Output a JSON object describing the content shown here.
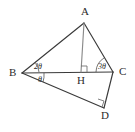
{
  "figure": {
    "type": "geometry-diagram",
    "background_color": "#ffffff",
    "stroke_color": "#3a3a3a",
    "altitude_color": "#8a8a8a",
    "vertices": [
      {
        "id": "A",
        "label": "A",
        "x": 84,
        "y": 23,
        "label_x": 81,
        "label_y": 6
      },
      {
        "id": "B",
        "label": "B",
        "x": 22,
        "y": 73,
        "label_x": 9,
        "label_y": 67
      },
      {
        "id": "C",
        "label": "C",
        "x": 113,
        "y": 72,
        "label_x": 119,
        "label_y": 66
      },
      {
        "id": "H",
        "label": "H",
        "x": 81,
        "y": 72,
        "label_x": 77,
        "label_y": 75
      },
      {
        "id": "D",
        "label": "D",
        "x": 104,
        "y": 108,
        "label_x": 101,
        "label_y": 110
      }
    ],
    "segments": [
      {
        "id": "BA",
        "from": "B",
        "to": "A",
        "style": "solid"
      },
      {
        "id": "AC",
        "from": "A",
        "to": "C",
        "style": "solid"
      },
      {
        "id": "BC",
        "from": "B",
        "to": "C",
        "style": "solid"
      },
      {
        "id": "AH",
        "from": "A",
        "to": "H",
        "style": "altitude"
      },
      {
        "id": "BD",
        "from": "B",
        "to": "D",
        "style": "solid"
      },
      {
        "id": "DC",
        "from": "D",
        "to": "C",
        "style": "solid"
      }
    ],
    "angle_labels": [
      {
        "id": "angle-ABC",
        "text": "2θ",
        "at_vertex": "B",
        "x": 34,
        "y": 63
      },
      {
        "id": "angle-DBC",
        "text": "θ",
        "at_vertex": "B",
        "x": 38,
        "y": 76
      },
      {
        "id": "angle-ACB",
        "text": "3θ",
        "at_vertex": "C",
        "x": 98,
        "y": 63
      }
    ],
    "right_angles": [
      {
        "id": "right-angle-H",
        "at_vertex": "H",
        "note": "AH perpendicular to BC"
      },
      {
        "id": "right-angle-D",
        "at_vertex": "D",
        "note": "BD perpendicular to DC"
      }
    ]
  }
}
